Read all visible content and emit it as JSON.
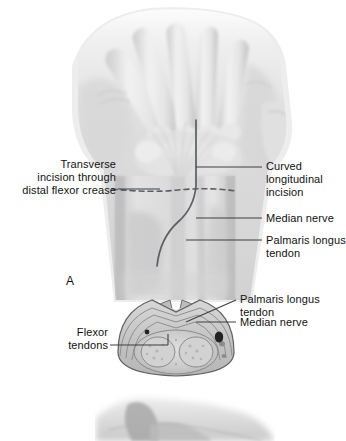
{
  "figure": {
    "background_color": "#ffffff",
    "line_color": "#3c3f44",
    "panels": [
      {
        "letter": "A",
        "name": "palmar-view-with-cross-section"
      }
    ]
  },
  "panel_letters": {
    "a": "A"
  },
  "labels": {
    "transverse_incision": {
      "lines": [
        "Transverse",
        "incision through",
        "distal flexor crease"
      ],
      "text": "Transverse incision through distal flexor crease",
      "side": "left"
    },
    "curved_incision": {
      "lines": [
        "Curved",
        "longitudinal",
        "incision"
      ],
      "text": "Curved longitudinal incision",
      "side": "right"
    },
    "median_nerve": {
      "lines": [
        "Median nerve"
      ],
      "text": "Median nerve",
      "side": "right"
    },
    "palmaris_longus_tendon": {
      "lines": [
        "Palmaris longus",
        "tendon"
      ],
      "text": "Palmaris longus tendon",
      "side": "right"
    },
    "flexor_tendons": {
      "lines": [
        "Flexor",
        "tendons"
      ],
      "text": "Flexor tendons",
      "side": "left"
    },
    "xsec_palmaris_longus_tendon": {
      "lines": [
        "Palmaris longus",
        "tendon"
      ],
      "text": "Palmaris longus tendon",
      "side": "right"
    },
    "xsec_median_nerve": {
      "lines": [
        "Median nerve"
      ],
      "text": "Median nerve",
      "side": "right"
    }
  },
  "colors": {
    "leader_line": "#3c3f44",
    "incision_line": "#5a5f66",
    "tissue_light": "#e9e9e9",
    "tissue_mid": "#cfcfcf",
    "tissue_dark": "#a8a8a8",
    "nerve_spot": "#262626"
  }
}
